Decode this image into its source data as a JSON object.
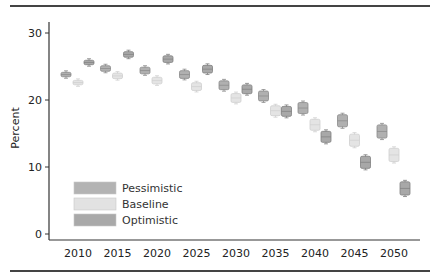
{
  "chart_data": {
    "type": "scatter",
    "title": "",
    "xlabel": "",
    "ylabel": "Percent",
    "x_ticks": [
      "2010",
      "2015",
      "2020",
      "2025",
      "2030",
      "2035",
      "2040",
      "2045",
      "2050"
    ],
    "y_ticks": [
      "0",
      "10",
      "20",
      "30"
    ],
    "ylim": [
      0,
      30
    ],
    "grid": false,
    "legend_position": "lower-left inside",
    "categories": [
      2010,
      2015,
      2020,
      2025,
      2030,
      2035,
      2040,
      2045,
      2050
    ],
    "series": [
      {
        "name": "Pessimistic",
        "color": "#b0b0b0",
        "values": [
          23.8,
          24.7,
          24.4,
          23.8,
          22.2,
          20.6,
          18.8,
          16.9,
          15.3
        ]
      },
      {
        "name": "Baseline",
        "color": "#e4e4e4",
        "values": [
          22.6,
          23.6,
          22.9,
          22.0,
          20.3,
          18.4,
          16.3,
          14.0,
          11.8
        ]
      },
      {
        "name": "Optimistic",
        "color": "#a8a8a8",
        "values": [
          25.6,
          26.8,
          26.1,
          24.6,
          21.6,
          18.3,
          14.5,
          10.7,
          6.8
        ]
      }
    ],
    "uncertainty_halfheight": [
      0.3,
      0.35,
      0.4,
      0.5,
      0.6,
      0.7,
      0.8,
      0.9,
      1.0
    ]
  },
  "legend": {
    "items": [
      {
        "label": "Pessimistic",
        "color": "#b3b3b3"
      },
      {
        "label": "Baseline",
        "color": "#e2e2e2"
      },
      {
        "label": "Optimistic",
        "color": "#a9a9a9"
      }
    ]
  },
  "axes": {
    "ylabel": "Percent"
  }
}
